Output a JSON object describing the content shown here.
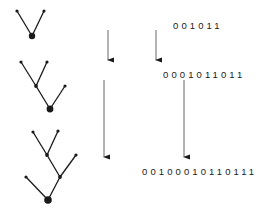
{
  "figure": {
    "ink_color": "#1a1a1a"
  },
  "trees": {
    "label": "tree-sequence",
    "items": [
      {
        "name": "tree-1",
        "nodes": [
          {
            "id": "root",
            "x": 32,
            "y": 36,
            "r": 3.2,
            "kind": "root"
          },
          {
            "id": "leaf-a",
            "x": 17,
            "y": 11,
            "r": 1.6,
            "kind": "leaf"
          },
          {
            "id": "leaf-b",
            "x": 44,
            "y": 11,
            "r": 1.6,
            "kind": "leaf"
          }
        ],
        "edges": [
          {
            "from": "root",
            "to": "leaf-a"
          },
          {
            "from": "root",
            "to": "leaf-b"
          }
        ]
      },
      {
        "name": "tree-2",
        "nodes": [
          {
            "id": "root",
            "x": 50,
            "y": 109,
            "r": 3.2,
            "kind": "root"
          },
          {
            "id": "internal",
            "x": 36,
            "y": 86,
            "r": 1.8,
            "kind": "internal"
          },
          {
            "id": "leaf-a",
            "x": 21,
            "y": 62,
            "r": 1.6,
            "kind": "leaf"
          },
          {
            "id": "leaf-b",
            "x": 47,
            "y": 62,
            "r": 1.6,
            "kind": "leaf"
          },
          {
            "id": "leaf-c",
            "x": 65,
            "y": 86,
            "r": 1.6,
            "kind": "leaf"
          }
        ],
        "edges": [
          {
            "from": "root",
            "to": "internal"
          },
          {
            "from": "internal",
            "to": "leaf-a"
          },
          {
            "from": "internal",
            "to": "leaf-b"
          },
          {
            "from": "root",
            "to": "leaf-c"
          }
        ]
      },
      {
        "name": "tree-3",
        "nodes": [
          {
            "id": "root",
            "x": 48,
            "y": 200,
            "r": 3.6,
            "kind": "root"
          },
          {
            "id": "internal-1",
            "x": 60,
            "y": 177,
            "r": 1.8,
            "kind": "internal"
          },
          {
            "id": "internal-2",
            "x": 47,
            "y": 155,
            "r": 1.8,
            "kind": "internal"
          },
          {
            "id": "leaf-a",
            "x": 33,
            "y": 132,
            "r": 1.6,
            "kind": "leaf"
          },
          {
            "id": "leaf-b",
            "x": 58,
            "y": 131,
            "r": 1.6,
            "kind": "leaf"
          },
          {
            "id": "leaf-c",
            "x": 76,
            "y": 155,
            "r": 1.6,
            "kind": "leaf"
          },
          {
            "id": "leaf-d",
            "x": 26,
            "y": 177,
            "r": 1.6,
            "kind": "leaf"
          }
        ],
        "edges": [
          {
            "from": "root",
            "to": "internal-1"
          },
          {
            "from": "internal-1",
            "to": "internal-2"
          },
          {
            "from": "internal-2",
            "to": "leaf-a"
          },
          {
            "from": "internal-2",
            "to": "leaf-b"
          },
          {
            "from": "internal-1",
            "to": "leaf-c"
          },
          {
            "from": "root",
            "to": "leaf-d"
          }
        ]
      }
    ]
  },
  "strings": {
    "top": "001011",
    "mid": "0001011011",
    "bottom": "00100010110111"
  },
  "arrows": [
    {
      "name": "arrow-top-left",
      "x": 176,
      "y1": 30,
      "y2": 62
    },
    {
      "name": "arrow-top-right",
      "x": 224,
      "y1": 30,
      "y2": 62
    },
    {
      "name": "arrow-bottom-left",
      "x": 172,
      "y1": 80,
      "y2": 159
    },
    {
      "name": "arrow-bottom-right",
      "x": 252,
      "y1": 80,
      "y2": 159
    }
  ]
}
